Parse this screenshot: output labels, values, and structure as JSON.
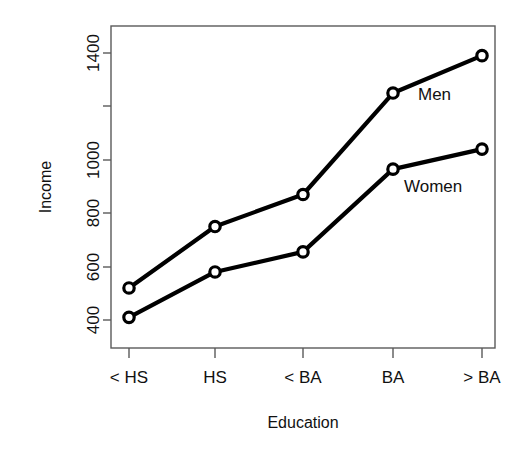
{
  "chart_data": {
    "type": "line",
    "title": "",
    "subtitle": "",
    "xlabel": "Education",
    "ylabel": "Income",
    "categories": [
      "< HS",
      "HS",
      "< BA",
      "BA",
      "> BA"
    ],
    "series": [
      {
        "name": "Men",
        "values": [
          520,
          750,
          870,
          1250,
          1390
        ]
      },
      {
        "name": "Women",
        "values": [
          410,
          580,
          655,
          965,
          1040
        ]
      }
    ],
    "ytick_labels": [
      "400",
      "600",
      "800",
      "1000",
      "1400"
    ],
    "yticks": [
      400,
      600,
      800,
      1000,
      1200,
      1400
    ],
    "ytick_labels_shown": [
      "400",
      "600",
      "800",
      "1000",
      "",
      "1400"
    ],
    "ylim": [
      330,
      1460
    ],
    "grid": false,
    "legend_position": "inline-annotation",
    "annotations": [
      {
        "text": "Men",
        "series": "Men"
      },
      {
        "text": "Women",
        "series": "Women"
      }
    ],
    "marker": "open-circle",
    "line_color": "#000000",
    "marker_fill": "#ffffff",
    "axis_color": "#5a5a5a"
  }
}
